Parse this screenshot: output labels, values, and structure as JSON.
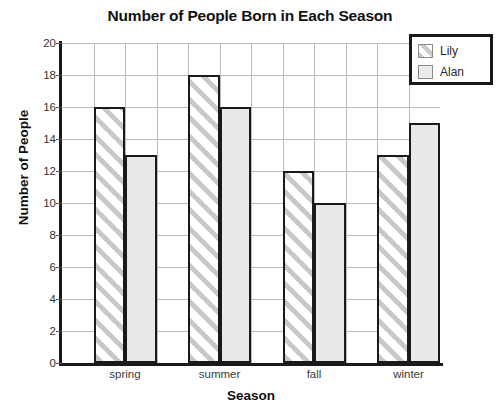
{
  "chart_data": {
    "type": "bar",
    "title": "Number of People Born in Each Season",
    "xlabel": "Season",
    "ylabel": "Number of People",
    "categories": [
      "spring",
      "summer",
      "fall",
      "winter"
    ],
    "series": [
      {
        "name": "Lily",
        "values": [
          16,
          18,
          12,
          13
        ],
        "fill": "hatched-diagonal",
        "color": "#c9c9c9"
      },
      {
        "name": "Alan",
        "values": [
          13,
          16,
          10,
          15
        ],
        "fill": "solid",
        "color": "#e9e9e9"
      }
    ],
    "ylim": [
      0,
      20
    ],
    "yticks": [
      0,
      2,
      4,
      6,
      8,
      10,
      12,
      14,
      16,
      18,
      20
    ],
    "ytick_labels": [
      "0",
      "2",
      "4",
      "6",
      "8",
      "10",
      "12",
      "14",
      "16",
      "18",
      "20"
    ],
    "grid": true,
    "grid_axis": "both",
    "legend_position": "top-right",
    "axis_color": "#1a1a1a",
    "grid_color": "#b9b9b9"
  }
}
